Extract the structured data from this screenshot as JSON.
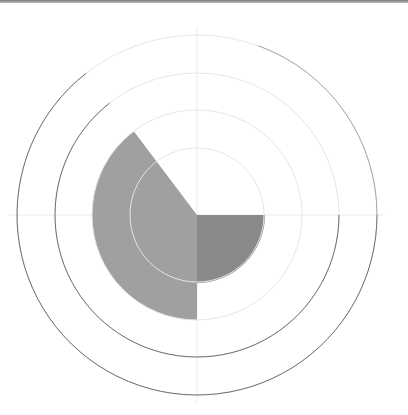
{
  "chart_data": {
    "type": "polar-area",
    "title": "",
    "center": [
      197,
      215
    ],
    "grid": {
      "rings": [
        67,
        105,
        142,
        180
      ],
      "ring_color_faint": "#e6e6e6",
      "ring_color_dark": "#6e6e6e",
      "dark_arc_range_deg": [
        90,
        322
      ],
      "axis_color": "#ececec"
    },
    "series": [
      {
        "name": "sector-dark",
        "start_deg": 90,
        "end_deg": 180,
        "radius": 68,
        "color": "#8a8a8a"
      },
      {
        "name": "sector-light",
        "start_deg": 180,
        "end_deg": 323,
        "radius": 105,
        "color": "#a0a0a0"
      }
    ],
    "values_relative": [
      {
        "sector": "90-180",
        "value": 1.0
      },
      {
        "sector": "180-323",
        "value": 1.55
      }
    ],
    "tick_labels": [],
    "legend": []
  },
  "frame": {
    "top_border_color": "#8a8a8a"
  }
}
